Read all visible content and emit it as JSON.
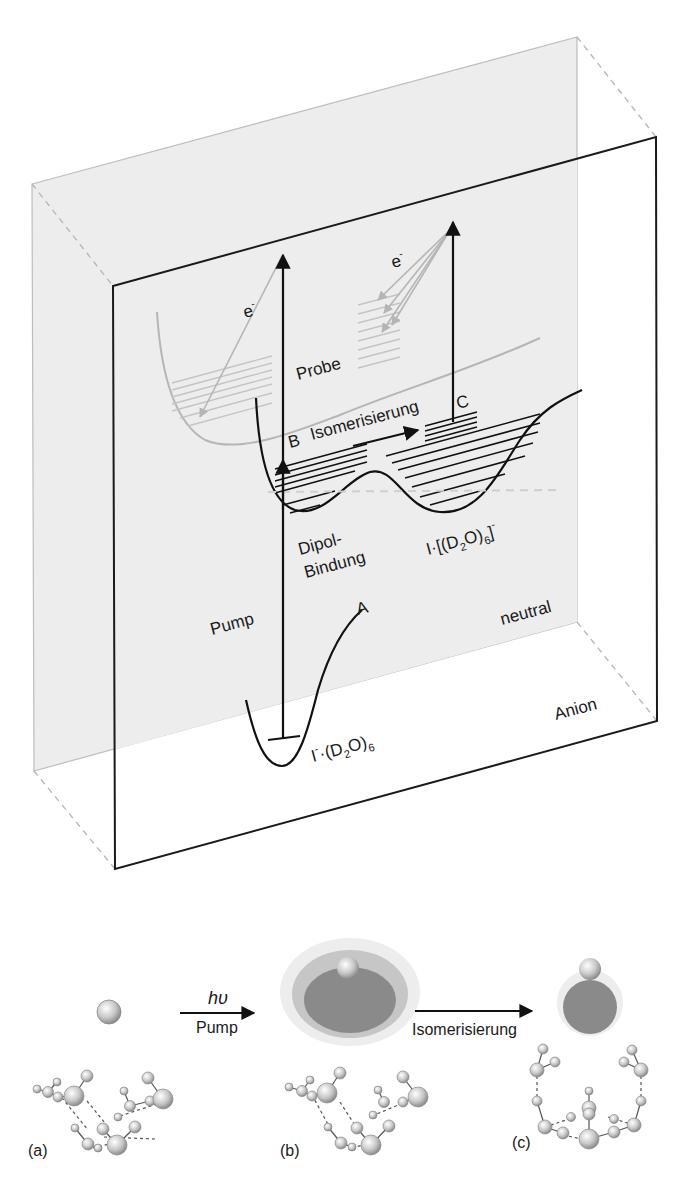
{
  "diagram": {
    "planes": {
      "neutral_label": "neutral",
      "anion_label": "Anion",
      "neutral_fill": "#ededed",
      "frame_color": "#1a1a1a",
      "back_frame_color": "#bdbdbd"
    },
    "potential_labels": {
      "electron_left": "e",
      "electron_right": "e",
      "electron_sup": "-",
      "probe": "Probe",
      "point_b": "B",
      "isomerization": "Isomerisierung",
      "point_c": "C",
      "dipole_line1": "Dipol-",
      "dipole_line2": "Bindung",
      "neutral_cluster": "I·[(D",
      "neutral_cluster_sub1": "2",
      "neutral_cluster_mid": "O)",
      "neutral_cluster_sub2": "6",
      "neutral_cluster_end": "]",
      "neutral_cluster_sup": "-",
      "pump": "Pump",
      "point_a": "A",
      "anion_cluster_i": "I",
      "anion_cluster_sup": "-",
      "anion_cluster_rest": "·(D",
      "anion_cluster_sub1": "2",
      "anion_cluster_mid": "O)",
      "anion_cluster_sub2": "6"
    },
    "reaction": {
      "step1_top": "hυ",
      "step1_bottom": "Pump",
      "step2_bottom": "Isomerisierung",
      "panel_a": "(a)",
      "panel_b": "(b)",
      "panel_c": "(c)",
      "electron_cloud_dark": "#8a8a8a",
      "electron_cloud_mid": "#c6c6c6",
      "electron_cloud_light": "#e8e8e8",
      "atom_fill": "#d0d0d0"
    }
  }
}
